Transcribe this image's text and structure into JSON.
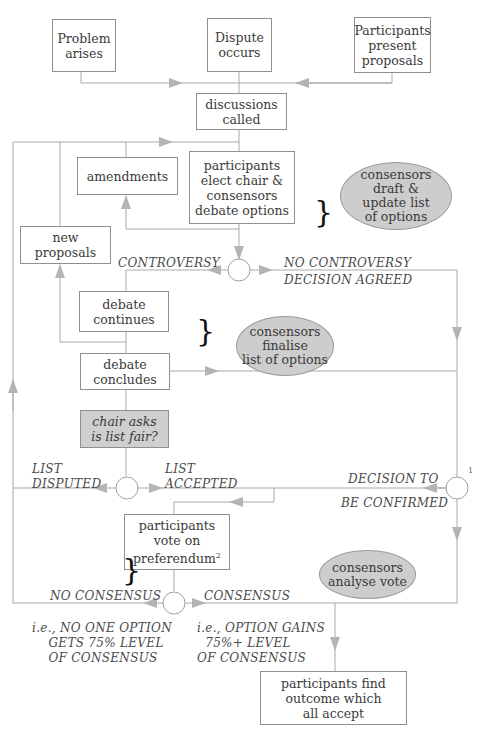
{
  "diagram": {
    "type": "flowchart"
  },
  "start_boxes": [
    {
      "id": "problem",
      "label": "Problem\narises"
    },
    {
      "id": "dispute",
      "label": "Dispute\noccurs"
    },
    {
      "id": "proposals",
      "label": "Participants\npresent\nproposals"
    }
  ],
  "process_boxes": {
    "discussions": "discussions\ncalled",
    "amendments": "amendments",
    "elect": "participants\nelect chair &\nconsensors\ndebate options",
    "new_proposals": "new\nproposals",
    "debate_continues": "debate\ncontinues",
    "debate_concludes": "debate\nconcludes",
    "chair_asks": "chair asks\nis list fair?",
    "vote_main": "participants\nvote on\npreferendum",
    "vote_footnote": "2",
    "outcome": "participants find\noutcome which\nall accept"
  },
  "consensor_notes": [
    {
      "id": "draft",
      "label": "consensors\ndraft &\nupdate list\nof options"
    },
    {
      "id": "finalise",
      "label": "consensors\nfinalise\nlist of options"
    },
    {
      "id": "analyse",
      "label": "consensors\nanalyse vote"
    }
  ],
  "branch_labels": {
    "controversy": "CONTROVERSY",
    "no_controversy": "NO CONTROVERSY",
    "decision_agreed": "DECISION AGREED",
    "list_disputed": "LIST\nDISPUTED",
    "list_accepted": "LIST\nACCEPTED",
    "decision_to": "DECISION TO",
    "be_confirmed": "BE CONFIRMED",
    "decision_footnote": "1",
    "no_consensus": "NO CONSENSUS",
    "consensus": "CONSENSUS",
    "no_consensus_note": "i.e., NO ONE OPTION\n    GETS 75% LEVEL\n    OF CONSENSUS",
    "consensus_note": "i.e., OPTION GAINS\n  75%+ LEVEL\nOF CONSENSUS"
  },
  "colors": {
    "line": "#a9a9a9",
    "arrow": "#b4b4b4",
    "box_border": "#8f8f8f",
    "note_fill": "#cdcdcd",
    "text": "#3a3a3a"
  }
}
